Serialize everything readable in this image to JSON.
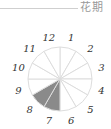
{
  "header": {
    "title": "花期"
  },
  "diagram": {
    "type": "month-wheel",
    "months": [
      "1",
      "2",
      "3",
      "4",
      "5",
      "6",
      "7",
      "8",
      "9",
      "10",
      "11",
      "12"
    ],
    "highlighted_months": [
      "7",
      "8"
    ],
    "colors": {
      "highlight": "#8a8a8a",
      "line": "#dddddd",
      "label": "#333333"
    }
  }
}
